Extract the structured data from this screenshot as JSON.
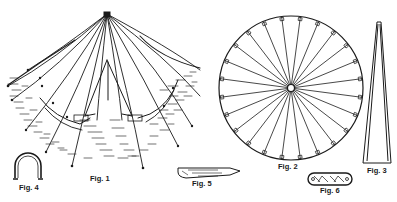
{
  "figures": [
    {
      "id": "fig1",
      "label": "Fig. 1",
      "description": "tent with guy ropes, perspective view"
    },
    {
      "id": "fig2",
      "label": "Fig. 2",
      "description": "circular tent floor plan with radial spokes"
    },
    {
      "id": "fig3",
      "label": "Fig. 3",
      "description": "tapered center pole"
    },
    {
      "id": "fig4",
      "label": "Fig. 4",
      "description": "U-shaped staple"
    },
    {
      "id": "fig5",
      "label": "Fig. 5",
      "description": "tent peg / stake"
    },
    {
      "id": "fig6",
      "label": "Fig. 6",
      "description": "slotted runner / slider"
    }
  ],
  "colors": {
    "ink": "#1a1a1a",
    "paper": "#ffffff",
    "hatch": "#333333"
  }
}
